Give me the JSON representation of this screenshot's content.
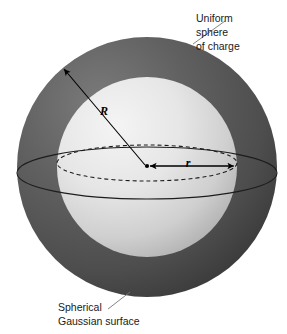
{
  "figure": {
    "background_color": "#ffffff"
  },
  "labels": {
    "outer_sphere": {
      "name": "uniform-sphere-of-charge",
      "lines": [
        "Uniform",
        "sphere",
        "of charge"
      ],
      "line1": "Uniform",
      "line2": "sphere",
      "line3": "of charge",
      "x": 196,
      "y": 22
    },
    "gaussian_surface": {
      "name": "spherical-gaussian-surface",
      "lines": [
        "Spherical",
        "Gaussian surface"
      ],
      "line1": "Spherical",
      "line2": "Gaussian surface",
      "x": 58,
      "y": 307
    }
  },
  "symbols": {
    "outer_radius": {
      "text": "R",
      "meaning": "radius of uniform sphere of charge",
      "x": 104,
      "y": 115
    },
    "gaussian_radius": {
      "text": "r",
      "meaning": "radius of spherical Gaussian surface",
      "x": 188,
      "y": 167
    }
  },
  "geometry": {
    "center": {
      "x": 147,
      "y": 167
    },
    "outer_sphere": {
      "radius": 130,
      "left": 17,
      "right": 277,
      "top": 37,
      "bottom": 297,
      "fill_dark": "#5c5c5c",
      "fill_shadow": "#3f3f3f"
    },
    "inner_sphere": {
      "radius": 90,
      "left": 57,
      "right": 237,
      "top": 77,
      "bottom": 257,
      "fill_light": "#ededed",
      "fill_mid": "#b9b9b9"
    },
    "equator_ellipse_rx": 130,
    "equator_ellipse_ry": 26,
    "gaussian_ellipse_rx": 90,
    "gaussian_ellipse_ry": 18
  },
  "colors": {
    "background": "#ffffff",
    "outer_sphere_gray": "#5c5c5c",
    "inner_sphere_light": "#ededed",
    "line_black": "#000000",
    "leader_gray": "#777777",
    "text_black": "#1a1a1a"
  }
}
